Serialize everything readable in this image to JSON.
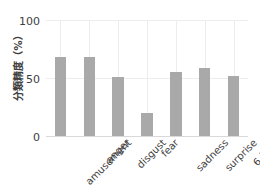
{
  "chart_data": {
    "type": "bar",
    "title": "",
    "xlabel": "",
    "ylabel": "分類精度（%）",
    "categories": [
      "amusement",
      "anger",
      "disgust",
      "fear",
      "sadness",
      "surprise",
      "6 情動"
    ],
    "values": [
      68,
      68,
      51,
      20,
      55,
      59,
      52
    ],
    "ylim": [
      0,
      100
    ],
    "yticks": [
      0,
      50,
      100
    ],
    "ytick_labels": [
      "0",
      "50",
      "100"
    ],
    "grid": true,
    "legend": null,
    "bar_color": "#a9a9a9",
    "grid_color": "#ededed",
    "text_color": "#3d3d3d"
  }
}
